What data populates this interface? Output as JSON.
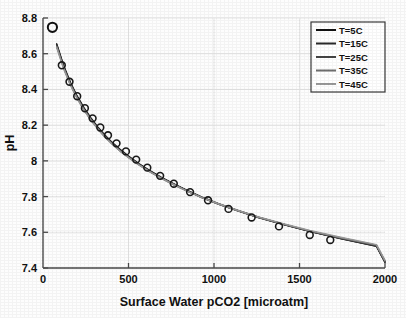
{
  "chart_data": {
    "type": "line",
    "title": "",
    "xlabel": "Surface Water pCO2 [microatm]",
    "ylabel": "pH",
    "xlim": [
      0,
      2000
    ],
    "ylim": [
      7.4,
      8.8
    ],
    "xticks": [
      0,
      500,
      1000,
      1500,
      2000
    ],
    "xtick_labels": [
      "0",
      "500",
      "1000",
      "1500",
      "2000"
    ],
    "yticks": [
      7.4,
      7.6,
      7.8,
      8.0,
      8.2,
      8.4,
      8.6,
      8.8
    ],
    "ytick_labels": [
      "7.4",
      "7.6",
      "7.8",
      "8",
      "8.2",
      "8.4",
      "8.6",
      "8.8"
    ],
    "grid": true,
    "legend_position": "top-right",
    "marker": "open-circle",
    "series": [
      {
        "name": "T=5C",
        "color": "#111111",
        "x": [
          80,
          120,
          160,
          200,
          240,
          280,
          320,
          360,
          400,
          450,
          500,
          560,
          620,
          690,
          760,
          840,
          930,
          1030,
          1140,
          1260,
          1400,
          1560,
          1740,
          1950,
          2000
        ],
        "y": [
          8.655,
          8.535,
          8.44,
          8.362,
          8.296,
          8.24,
          8.19,
          8.146,
          8.107,
          8.064,
          8.026,
          7.985,
          7.948,
          7.909,
          7.874,
          7.836,
          7.797,
          7.759,
          7.722,
          7.684,
          7.646,
          7.606,
          7.565,
          7.522,
          7.432
        ]
      },
      {
        "name": "T=15C",
        "color": "#2a2a2a",
        "x": [
          80,
          120,
          160,
          200,
          240,
          280,
          320,
          360,
          400,
          450,
          500,
          560,
          620,
          690,
          760,
          840,
          930,
          1030,
          1140,
          1260,
          1400,
          1560,
          1740,
          1950,
          2000
        ],
        "y": [
          8.65,
          8.53,
          8.436,
          8.358,
          8.292,
          8.236,
          8.186,
          8.142,
          8.104,
          8.061,
          8.023,
          7.982,
          7.945,
          7.906,
          7.871,
          7.834,
          7.795,
          7.757,
          7.72,
          7.683,
          7.645,
          7.605,
          7.565,
          7.523,
          7.434
        ]
      },
      {
        "name": "T=25C",
        "color": "#444444",
        "x": [
          80,
          120,
          160,
          200,
          240,
          280,
          320,
          360,
          400,
          450,
          500,
          560,
          620,
          690,
          760,
          840,
          930,
          1030,
          1140,
          1260,
          1400,
          1560,
          1740,
          1950,
          2000
        ],
        "y": [
          8.645,
          8.526,
          8.432,
          8.354,
          8.289,
          8.233,
          8.183,
          8.139,
          8.101,
          8.058,
          8.021,
          7.98,
          7.943,
          7.905,
          7.87,
          7.833,
          7.794,
          7.757,
          7.72,
          7.683,
          7.646,
          7.606,
          7.566,
          7.525,
          7.436
        ]
      },
      {
        "name": "T=35C",
        "color": "#6e6e6e",
        "x": [
          80,
          120,
          160,
          200,
          240,
          280,
          320,
          360,
          400,
          450,
          500,
          560,
          620,
          690,
          760,
          840,
          930,
          1030,
          1140,
          1260,
          1400,
          1560,
          1740,
          1950,
          2000
        ],
        "y": [
          8.64,
          8.522,
          8.428,
          8.351,
          8.286,
          8.23,
          8.181,
          8.137,
          8.099,
          8.056,
          8.019,
          7.979,
          7.942,
          7.904,
          7.869,
          7.832,
          7.794,
          7.757,
          7.721,
          7.684,
          7.647,
          7.608,
          7.569,
          7.528,
          7.439
        ]
      },
      {
        "name": "T=45C",
        "color": "#999999",
        "x": [
          80,
          120,
          160,
          200,
          240,
          280,
          320,
          360,
          400,
          450,
          500,
          560,
          620,
          690,
          760,
          840,
          930,
          1030,
          1140,
          1260,
          1400,
          1560,
          1740,
          1950,
          2000
        ],
        "y": [
          8.636,
          8.518,
          8.425,
          8.348,
          8.283,
          8.228,
          8.179,
          8.135,
          8.097,
          8.055,
          8.018,
          7.978,
          7.941,
          7.903,
          7.869,
          7.832,
          7.794,
          7.758,
          7.722,
          7.686,
          7.649,
          7.61,
          7.572,
          7.531,
          7.443
        ]
      }
    ],
    "markers": {
      "name": "data-markers",
      "x": [
        110,
        155,
        200,
        245,
        290,
        335,
        380,
        430,
        485,
        545,
        610,
        685,
        765,
        860,
        965,
        1085,
        1220,
        1380,
        1560,
        1680
      ],
      "y": [
        8.535,
        8.443,
        8.362,
        8.295,
        8.238,
        8.187,
        8.143,
        8.098,
        8.053,
        8.007,
        7.962,
        7.916,
        7.872,
        7.825,
        7.779,
        7.731,
        7.683,
        7.633,
        7.585,
        7.557
      ]
    },
    "outlier_point": {
      "label": "isolated-open-circle",
      "x": 55,
      "y": 8.748
    },
    "legend": [
      {
        "label": "T=5C",
        "color": "#111111"
      },
      {
        "label": "T=15C",
        "color": "#2a2a2a"
      },
      {
        "label": "T=25C",
        "color": "#444444"
      },
      {
        "label": "T=35C",
        "color": "#6e6e6e"
      },
      {
        "label": "T=45C",
        "color": "#999999"
      }
    ]
  }
}
